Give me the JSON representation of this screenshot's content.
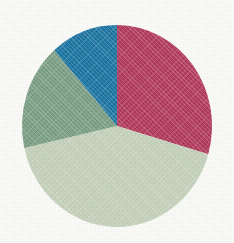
{
  "figure": {
    "background_color": "#fdfdfb",
    "width": 234,
    "height": 243
  },
  "chart_data": {
    "type": "pie",
    "title": "",
    "subtitle": "",
    "xlabel": "",
    "ylabel": "",
    "legend": "none",
    "grid": false,
    "labels": [
      "Slice 1",
      "Slice 2",
      "Slice 3",
      "Slice 4"
    ],
    "values": [
      29.5,
      42.0,
      17.0,
      11.5
    ],
    "units": "percent",
    "total": 100,
    "start_angle_deg": 0,
    "direction": "clockwise",
    "center": {
      "x": 117,
      "y": 126
    },
    "radius": {
      "rx": 95,
      "ry": 101
    },
    "colors": [
      "#b33a5c",
      "#c6d3bc",
      "#7ca085",
      "#1c76a4"
    ],
    "slices": [
      {
        "name": "Slice 1",
        "value": 29.5,
        "color": "#b33a5c",
        "color_name": "crimson",
        "start_angle_deg": 0,
        "end_angle_deg": 106.2,
        "data_label": ""
      },
      {
        "name": "Slice 2",
        "value": 42.0,
        "color": "#c6d3bc",
        "color_name": "pale-green",
        "start_angle_deg": 106.2,
        "end_angle_deg": 257.4,
        "data_label": ""
      },
      {
        "name": "Slice 3",
        "value": 17.0,
        "color": "#7ca085",
        "color_name": "medium-green",
        "start_angle_deg": 257.4,
        "end_angle_deg": 318.6,
        "data_label": ""
      },
      {
        "name": "Slice 4",
        "value": 11.5,
        "color": "#1c76a4",
        "color_name": "blue",
        "start_angle_deg": 318.6,
        "end_angle_deg": 360,
        "data_label": ""
      }
    ]
  }
}
